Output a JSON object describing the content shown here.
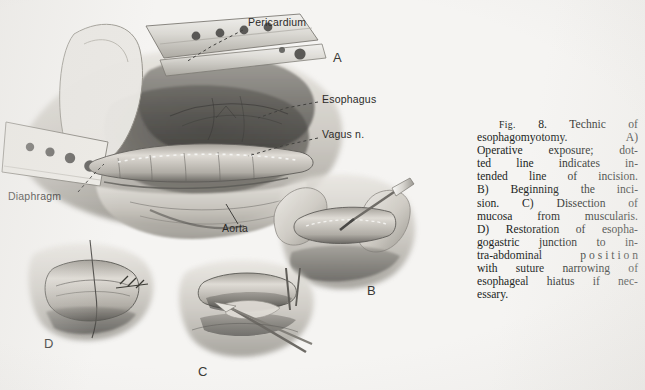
{
  "document": {
    "type": "scanned-journal-figure",
    "background_color": "#f5f4f2",
    "ink_color": "#211f1d"
  },
  "figure": {
    "number": "FIG. 8.",
    "panel_letters": [
      "A",
      "B",
      "C",
      "D"
    ],
    "annotations": [
      {
        "name": "pericardium",
        "label": "Pericardium",
        "x": 248,
        "y": 22
      },
      {
        "name": "esophagus",
        "label": "Esophagus",
        "x": 322,
        "y": 99
      },
      {
        "name": "vagus-nerve",
        "label": "Vagus n.",
        "x": 322,
        "y": 134
      },
      {
        "name": "diaphragm",
        "label": "Diaphragm",
        "x": 8,
        "y": 196
      },
      {
        "name": "aorta",
        "label": "Aorta",
        "x": 222,
        "y": 228
      }
    ],
    "panels": [
      {
        "letter": "A",
        "x": 333,
        "y": 57,
        "description": "Operative exposure; dotted line indicates intended line of incision."
      },
      {
        "letter": "B",
        "x": 367,
        "y": 290,
        "description": "Beginning the incision."
      },
      {
        "letter": "C",
        "x": 198,
        "y": 371,
        "description": "Dissection of mucosa from muscularis."
      },
      {
        "letter": "D",
        "x": 44,
        "y": 343,
        "description": "Restoration of esophagogastric junction to intra-abdominal position."
      }
    ]
  },
  "caption": {
    "fig_label": "Fig.",
    "fig_number": "8.",
    "full_text": "Fig. 8. Technic of esophagomyotomy. A) Operative exposure; dotted line indicates intended line of incision. B) Beginning the incision. C) Dissection of mucosa from muscularis. D) Restoration of esophagogastric junction to intra-abdominal position with suture narrowing of esophageal hiatus if necessary.",
    "lines": [
      [
        "Technic",
        "of"
      ],
      [
        "esophagomyotomy.",
        "A)"
      ],
      [
        "Operative",
        "exposure;",
        "dot-"
      ],
      [
        "ted",
        "line",
        "indicates",
        "in-"
      ],
      [
        "tended",
        "line",
        "of",
        "incision."
      ],
      [
        "B)",
        "Beginning",
        "the",
        "inci-"
      ],
      [
        "sion.",
        "C)",
        "Dissection",
        "of"
      ],
      [
        "mucosa",
        "from",
        "muscularis."
      ],
      [
        "D)",
        "Restoration",
        "of",
        "esopha-"
      ],
      [
        "gogastric",
        "junction",
        "to",
        "in-"
      ],
      [
        "tra-abdominal",
        "p o s i t i o n"
      ],
      [
        "with",
        "suture",
        "narrowing",
        "of"
      ],
      [
        "esophageal",
        "hiatus",
        "if",
        "nec-"
      ],
      [
        "essary."
      ]
    ]
  }
}
